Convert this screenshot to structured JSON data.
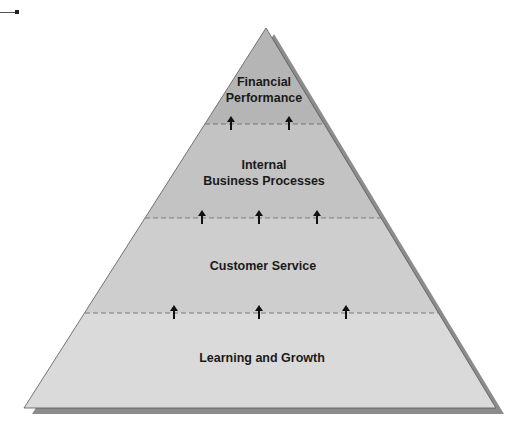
{
  "diagram": {
    "type": "pyramid",
    "direction": "bottom-to-top",
    "levels": [
      {
        "label_line1": "Financial",
        "label_line2": "Performance",
        "fill": "#b5b5b5",
        "arrows_up_to_level": 0
      },
      {
        "label_line1": "Internal",
        "label_line2": "Business Processes",
        "fill": "#c3c3c3",
        "arrows_count": 2
      },
      {
        "label_line1": "Customer Service",
        "label_line2": "",
        "fill": "#cecece",
        "arrows_count": 3
      },
      {
        "label_line1": "Learning and Growth",
        "label_line2": "",
        "fill": "#dadada",
        "arrows_count": 3
      }
    ],
    "connector": {
      "style": "dashed",
      "color": "#7a7a7a",
      "arrow_color": "#111111"
    },
    "shadow_color": "#8c8c8c",
    "outline_color": "#555555"
  }
}
